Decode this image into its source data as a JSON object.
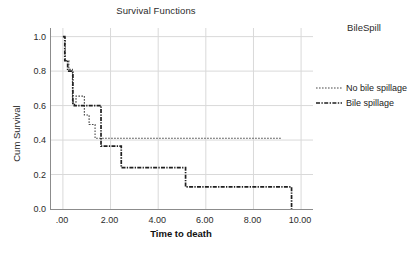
{
  "chart_data": {
    "type": "line",
    "title": "Survival Functions",
    "xlabel": "Time to death",
    "ylabel": "Cum Survival",
    "xlim": [
      -0.5,
      10.5
    ],
    "ylim": [
      0.0,
      1.05
    ],
    "grid": true,
    "legend_position": "right",
    "legend_title": "BileSpill",
    "x_ticks": [
      ".00",
      "2.00",
      "4.00",
      "6.00",
      "8.00",
      "10.00"
    ],
    "x_tick_values": [
      0,
      2,
      4,
      6,
      8,
      10
    ],
    "y_ticks": [
      "0.0",
      "0.2",
      "0.4",
      "0.6",
      "0.8",
      "1.0"
    ],
    "y_tick_values": [
      0.0,
      0.2,
      0.4,
      0.6,
      0.8,
      1.0
    ],
    "series": [
      {
        "name": "No bile spillage",
        "style": "dotted",
        "color": "#4a4a4a",
        "x": [
          0.0,
          0.1,
          0.1,
          0.25,
          0.25,
          0.4,
          0.4,
          0.55,
          0.55,
          0.9,
          0.9,
          1.1,
          1.1,
          1.35,
          1.35,
          9.2
        ],
        "y": [
          1.0,
          1.0,
          0.86,
          0.86,
          0.81,
          0.81,
          0.62,
          0.62,
          0.655,
          0.655,
          0.545,
          0.545,
          0.49,
          0.49,
          0.41,
          0.41
        ]
      },
      {
        "name": "Bile spillage",
        "style": "dash-dot",
        "color": "#1f1f1f",
        "x": [
          0.0,
          0.08,
          0.08,
          0.2,
          0.2,
          0.42,
          0.42,
          0.48,
          0.48,
          1.6,
          1.6,
          2.45,
          2.45,
          5.15,
          5.15,
          9.6,
          9.6
        ],
        "y": [
          1.0,
          1.0,
          0.86,
          0.86,
          0.8,
          0.8,
          0.605,
          0.605,
          0.6,
          0.6,
          0.365,
          0.365,
          0.24,
          0.24,
          0.128,
          0.128,
          0.0
        ]
      }
    ]
  }
}
